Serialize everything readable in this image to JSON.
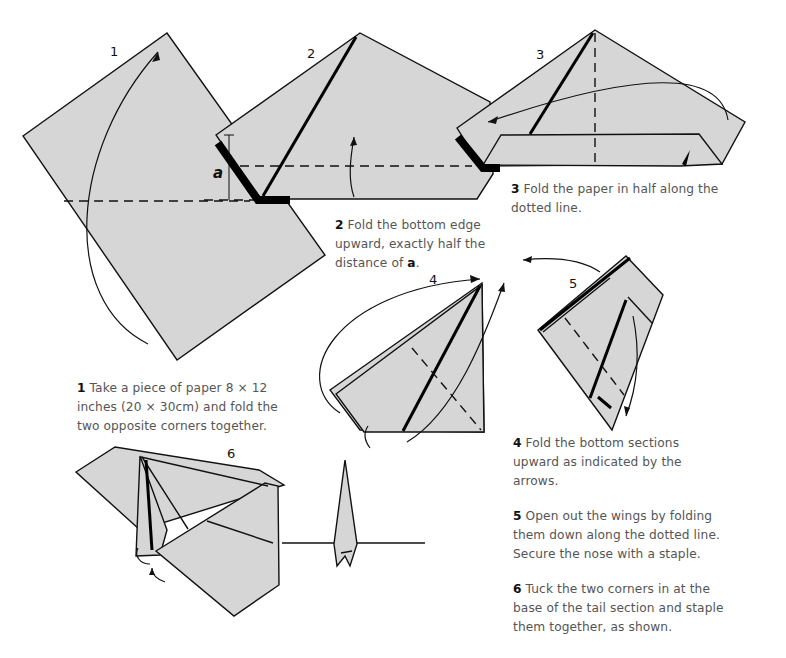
{
  "steps": [
    {
      "number": "1",
      "bold": "1",
      "text": " Take a piece of paper 8 × 12 inches (20 × 30cm) and fold the two opposite corners together.",
      "lines": [
        "Take a piece of paper 8 × 12",
        "inches (20 × 30cm) and fold the",
        "two opposite corners together."
      ]
    },
    {
      "number": "2",
      "bold": "2",
      "lines": [
        "Fold the bottom edge",
        "upward, exactly half the",
        "distance of "
      ],
      "bold_suffix": "a",
      "suffix": "."
    },
    {
      "number": "3",
      "bold": "3",
      "lines": [
        "Fold the paper in half along the",
        "dotted line."
      ]
    },
    {
      "number": "4",
      "bold": "4",
      "lines": [
        "Fold the bottom sections",
        "upward as indicated by the",
        "arrows."
      ]
    },
    {
      "number": "5",
      "bold": "5",
      "lines": [
        "Open out the wings by folding",
        "them down along the dotted line.",
        "Secure the nose with a staple."
      ]
    },
    {
      "number": "6",
      "bold": "6",
      "lines": [
        "Tuck the two corners in at the",
        "base of the tail section and staple",
        "them together, as shown."
      ]
    }
  ],
  "measure_label": "a",
  "colors": {
    "paper": "#d6d6d6",
    "ink": "#111111",
    "caption": "#555555"
  }
}
